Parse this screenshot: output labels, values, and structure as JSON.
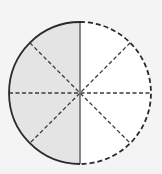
{
  "diagram": {
    "type": "fraction-circle",
    "total_parts": 8,
    "shaded_parts": 4,
    "fraction_shaded": "4/8",
    "colors": {
      "background": "#f4f4f4",
      "shaded_fill": "#e4e4e4",
      "unshaded_fill": "#ffffff",
      "solid_stroke": "#2a2a2a",
      "center_line": "#6a6a6a",
      "dashed_stroke": "#3a3a3a"
    },
    "geometry": {
      "cx": 80,
      "cy": 93,
      "r": 71
    }
  }
}
